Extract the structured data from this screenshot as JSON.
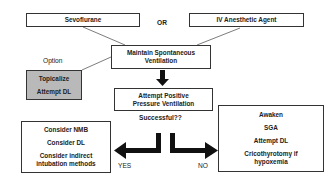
{
  "diagram": {
    "start_options": {
      "left": "Sevoflurane",
      "separator": "OR",
      "right": "IV Anesthetic Agent"
    },
    "maintain": [
      "Maintain Spontaneous",
      "Ventilation"
    ],
    "option": {
      "label": "Option",
      "items": [
        "Topicalize",
        "Attempt DL"
      ]
    },
    "ppv": [
      "Attempt Positive",
      "Pressure Ventilation"
    ],
    "question": "Successful??",
    "yes": {
      "label": "YES",
      "items": [
        "Consider NMB",
        "Consider DL",
        "Consider indirect",
        "intubation methods"
      ]
    },
    "no": {
      "label": "NO",
      "items": [
        "Awaken",
        "SGA",
        "Attempt DL",
        "Cricothyrotomy if",
        "hypoxemia"
      ]
    },
    "colors": {
      "option_fill": "#b9b9b9",
      "border": "#333333",
      "arrow": "#111111"
    }
  }
}
